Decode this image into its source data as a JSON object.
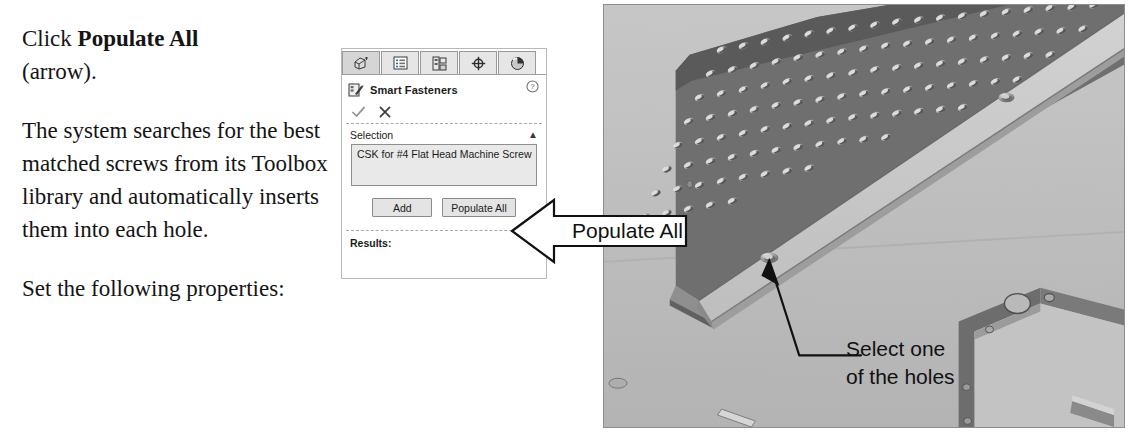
{
  "instructions": {
    "p1_prefix": "Click ",
    "p1_bold": "Populate All",
    "p1_suffix": " (arrow).",
    "p2": "The system searches for the best matched screws from its Toolbox library and automatically inserts them into each hole.",
    "p3": "Set the following properties:"
  },
  "property_manager": {
    "tabs": [
      {
        "name": "feature-manager-design-tree",
        "icon": "tree-icon",
        "active": true
      },
      {
        "name": "property-manager",
        "icon": "list-icon",
        "active": false
      },
      {
        "name": "configuration-manager",
        "icon": "config-icon",
        "active": false
      },
      {
        "name": "dimxpert-manager",
        "icon": "crosshair-icon",
        "active": false
      },
      {
        "name": "display-manager",
        "icon": "appearance-sphere-icon",
        "active": false
      }
    ],
    "title": "Smart Fasteners",
    "title_icon": "smart-fasteners-icon",
    "help_icon": "help-question-icon",
    "ok_icon": "checkmark-icon",
    "cancel_icon": "x-cancel-icon",
    "selection": {
      "group_label": "Selection",
      "collapse_icon": "chevron-up-icon",
      "value": "CSK for #4 Flat Head Machine Screw"
    },
    "buttons": {
      "add": "Add",
      "populate_all": "Populate All"
    },
    "results": {
      "label": "Results:",
      "collapse_icon": "chevron-up-icon"
    }
  },
  "callouts": {
    "populate_all": "Populate All",
    "select_holes_line1": "Select one",
    "select_holes_line2": "of the holes"
  },
  "model_image": {
    "description": "Isometric shaded view of a sheet-metal chassis with a perforated ventilation panel, a flanged rail containing countersunk holes, and an end bracket",
    "colors": {
      "background": "#bcbcbc",
      "panel_dark": "#6f6f6f",
      "panel_mid": "#9a9a9a",
      "panel_light": "#c6c6c6",
      "edge": "#4a4a4a"
    }
  }
}
